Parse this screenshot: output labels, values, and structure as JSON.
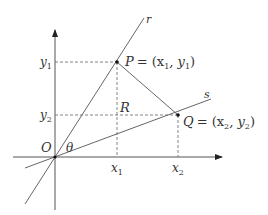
{
  "diagram": {
    "origin_label": "O",
    "angle_label": "θ",
    "region_label": "R",
    "line_r_label": "r",
    "line_s_label": "s",
    "point_p": {
      "name": "P",
      "coords": "= (x",
      "x_sub": "1",
      "sep": ", y",
      "y_sub": "1",
      "close": ")"
    },
    "point_q": {
      "name": "Q",
      "coords": "= (x",
      "x_sub": "2",
      "sep": ", y",
      "y_sub": "2",
      "close": ")"
    },
    "x_ticks": [
      {
        "base": "x",
        "sub": "1"
      },
      {
        "base": "x",
        "sub": "2"
      }
    ],
    "y_ticks": [
      {
        "base": "y",
        "sub": "1"
      },
      {
        "base": "y",
        "sub": "2"
      }
    ],
    "colors": {
      "line": "#555555",
      "text": "#333333",
      "point": "#111111"
    }
  }
}
